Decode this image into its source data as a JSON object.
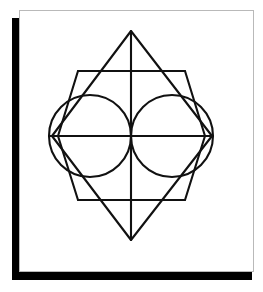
{
  "canvas": {
    "width": 263,
    "height": 292,
    "background_color": "#ffffff"
  },
  "card": {
    "label": "white-paper-card",
    "x": 19,
    "y": 10,
    "width": 235,
    "height": 262,
    "fill_color": "#ffffff",
    "border_color": "#b9b9b9",
    "border_width": 1
  },
  "shadow": {
    "label": "offset-drop-shadow",
    "x": 12,
    "y": 18,
    "width": 240,
    "height": 262,
    "color": "#000000"
  },
  "figure": {
    "stroke_color": "#111111",
    "stroke_width": 2.1,
    "viewbox": "0 0 235 262",
    "diamond": {
      "label": "outer-rhombus",
      "top": [
        112,
        21
      ],
      "right": [
        193,
        126
      ],
      "bottom": [
        112,
        230
      ],
      "left": [
        33,
        126
      ]
    },
    "hexagon": {
      "label": "inner-barrel-hexagon",
      "points": [
        [
          59,
          61
        ],
        [
          166,
          61
        ],
        [
          186,
          126
        ],
        [
          166,
          190
        ],
        [
          59,
          190
        ],
        [
          39,
          126
        ]
      ]
    },
    "circles": [
      {
        "label": "left-circle",
        "cx": 71,
        "cy": 126,
        "r": 41
      },
      {
        "label": "right-circle",
        "cx": 153,
        "cy": 126,
        "r": 41
      }
    ],
    "lines": [
      {
        "label": "vertical-axis",
        "x1": 112,
        "y1": 21,
        "x2": 112,
        "y2": 230
      },
      {
        "label": "horizontal-axis",
        "x1": 30,
        "y1": 126,
        "x2": 194,
        "y2": 126
      },
      {
        "label": "upper-horizontal-chord",
        "x1": 59,
        "y1": 61,
        "x2": 166,
        "y2": 61
      },
      {
        "label": "lower-horizontal-chord",
        "x1": 59,
        "y1": 190,
        "x2": 166,
        "y2": 190
      }
    ]
  }
}
